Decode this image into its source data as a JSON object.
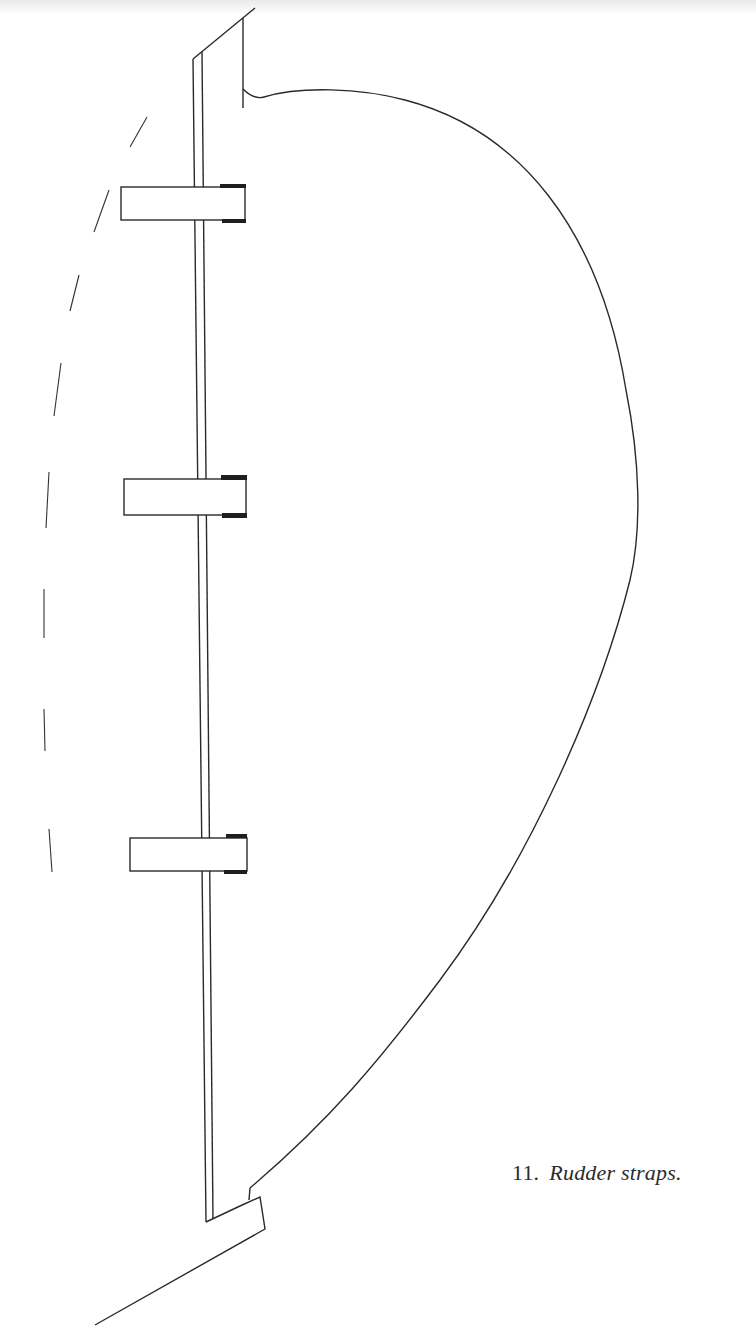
{
  "figure": {
    "number": "11.",
    "caption": "Rudder straps.",
    "colors": {
      "background": "#ffffff",
      "ink": "#2a2a2a",
      "strap_cap": "#1e1e1e"
    },
    "elements": {
      "rudder_post": {
        "label": "rudder-post"
      },
      "rudder_blade": {
        "label": "rudder-blade-outline"
      },
      "straps": [
        {
          "label": "upper-strap",
          "x": 121,
          "y": 187,
          "width": 124,
          "height": 33
        },
        {
          "label": "middle-strap",
          "x": 124,
          "y": 478,
          "width": 122,
          "height": 37
        },
        {
          "label": "lower-strap",
          "x": 130,
          "y": 837,
          "width": 117,
          "height": 34
        }
      ],
      "sternpost_dashed": {
        "label": "sternpost-dashed-outline",
        "dash_count": 8
      },
      "keel_heel": {
        "label": "heel-and-keel-line"
      }
    }
  }
}
